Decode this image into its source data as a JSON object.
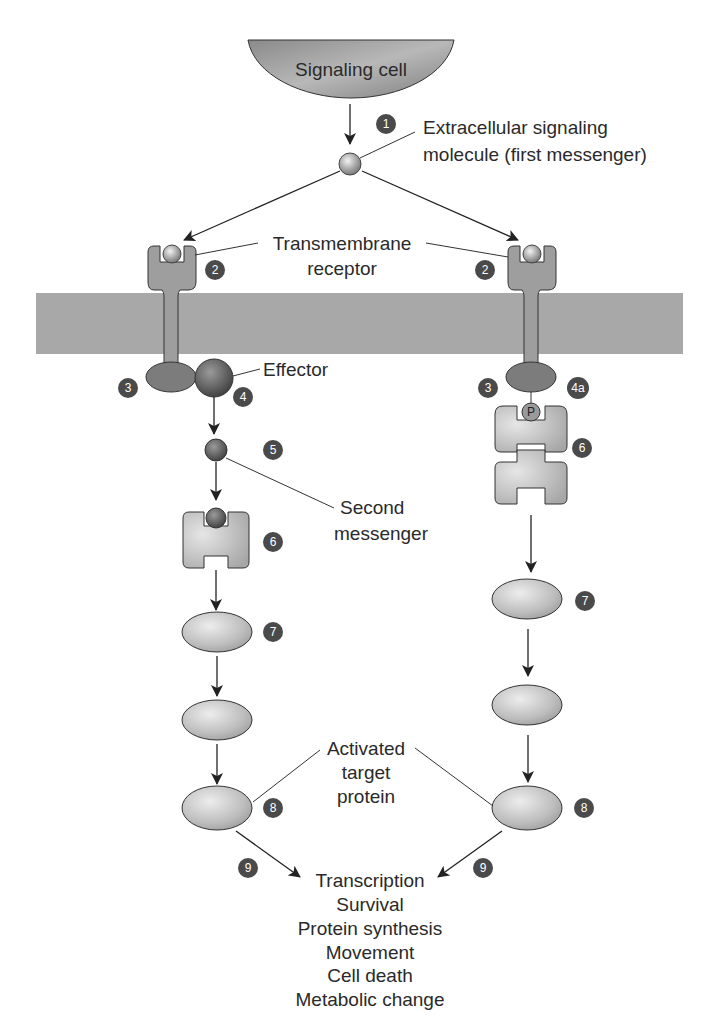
{
  "diagram": {
    "colors": {
      "membrane": "#a8a8a8",
      "receptor": "#9e9e9e",
      "receptor_dark": "#7c7c7c",
      "effector": "#6e6e6e",
      "ellipse_fill": "#c4c4c4",
      "badge": "#4a4a4a",
      "text": "#2a2a2a"
    },
    "signaling_cell": {
      "label": "Signaling cell"
    },
    "labels": {
      "first_messenger_line1": "Extracellular signaling",
      "first_messenger_line2": "molecule (first messenger)",
      "receptor_line1": "Transmembrane",
      "receptor_line2": "receptor",
      "effector": "Effector",
      "second_messenger_line1": "Second",
      "second_messenger_line2": "messenger",
      "target_line1": "Activated",
      "target_line2": "target",
      "target_line3": "protein",
      "phosphate": "P"
    },
    "steps": {
      "s1": "1",
      "s2_left": "2",
      "s2_right": "2",
      "s3_left": "3",
      "s3_right": "3",
      "s4": "4",
      "s4a": "4a",
      "s5": "5",
      "s6_left": "6",
      "s6_right": "6",
      "s7_left": "7",
      "s7_right": "7",
      "s8_left": "8",
      "s8_right": "8",
      "s9_left": "9",
      "s9_right": "9"
    },
    "outcomes": [
      "Transcription",
      "Survival",
      "Protein synthesis",
      "Movement",
      "Cell death",
      "Metabolic change"
    ]
  }
}
